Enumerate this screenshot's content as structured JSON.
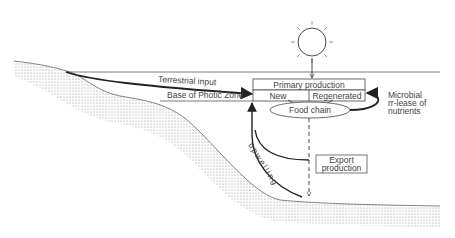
{
  "diagram": {
    "labels": {
      "terrestrial_input": "Terrestrial input",
      "base_photic_zone": "Base of Photic Zone",
      "primary_production": "Primary production",
      "new": "New",
      "regenerated": "Regenerated",
      "food_chain": "Food chain",
      "microbial_line1": "Microbial",
      "microbial_line2": "rr-lease of",
      "microbial_line3": "nutrients",
      "export_line1": "Export",
      "export_line2": "production",
      "upwelling": "upwelling"
    },
    "icons": {
      "sun": "sun-icon"
    },
    "colors": {
      "line": "#222222",
      "text": "#444444",
      "seabed_dots": "#888888",
      "background": "#ffffff"
    }
  }
}
